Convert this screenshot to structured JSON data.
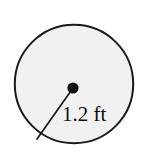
{
  "figure": {
    "name": "circle-with-radius",
    "type": "geometry-diagram",
    "shape": "circle",
    "background_color": "#ffffff",
    "circle": {
      "fill_color": "#f1f1f1",
      "stroke_color": "#1a1a1a",
      "stroke_width": 2,
      "center_x": 74,
      "center_y": 84,
      "radius": 60
    },
    "center_dot": {
      "color": "#111111",
      "radius": 5.5,
      "x": 73,
      "y": 88
    },
    "radius_segment": {
      "stroke_color": "#1a1a1a",
      "stroke_width": 1.6,
      "from_x": 73,
      "from_y": 88,
      "to_x": 37,
      "to_y": 139
    },
    "label": {
      "text": "1.2 ft",
      "value": "1.2",
      "unit": "ft",
      "x": 62,
      "y": 120,
      "color": "#111111"
    }
  }
}
